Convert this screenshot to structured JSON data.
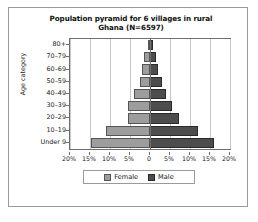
{
  "chart_data": {
    "type": "bar",
    "subtype": "population-pyramid",
    "title": "Population pyramid for 6 villages in rural Ghana (N=6597)",
    "title_line1": "Population pyramid for 6 villages in rural",
    "title_line2": "Ghana (N=6597)",
    "xlabel": "",
    "ylabel": "Age category",
    "categories": [
      "Under 9",
      "10–19",
      "20–29",
      "30–39",
      "40–49",
      "50–59",
      "60–69",
      "70–79",
      "80+"
    ],
    "series": [
      {
        "name": "Female",
        "color": "#9d9d9d",
        "side": "left",
        "values": [
          14.8,
          11.1,
          5.6,
          5.6,
          4.0,
          2.6,
          2.0,
          1.4,
          0.6
        ]
      },
      {
        "name": "Male",
        "color": "#4d4d4d",
        "side": "right",
        "values": [
          16.0,
          12.0,
          7.3,
          5.6,
          4.0,
          2.9,
          2.1,
          1.4,
          0.7
        ]
      }
    ],
    "xticks": [
      "20%",
      "15%",
      "10%",
      "5%",
      "0",
      "5%",
      "10%",
      "15%",
      "20%"
    ],
    "xtick_values": [
      -20,
      -15,
      -10,
      -5,
      0,
      5,
      10,
      15,
      20
    ],
    "xlim": [
      -20,
      20
    ],
    "grid": true,
    "legend_position": "bottom",
    "legend": [
      "Female",
      "Male"
    ]
  }
}
